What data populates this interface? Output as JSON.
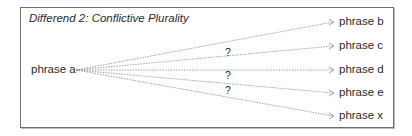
{
  "diagram": {
    "title": "Differend 2: Conflictive Plurality",
    "source": "phrase a",
    "targets": [
      {
        "label": "phrase b",
        "y": 22,
        "question": ""
      },
      {
        "label": "phrase c",
        "y": 46,
        "question": "?"
      },
      {
        "label": "phrase d",
        "y": 70,
        "question": "?"
      },
      {
        "label": "phrase e",
        "y": 93,
        "question": "?"
      },
      {
        "label": "phrase x",
        "y": 116,
        "question": ""
      }
    ],
    "line_color": "#8a8a8a",
    "text_color": "#2a2a2a"
  }
}
